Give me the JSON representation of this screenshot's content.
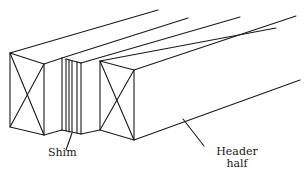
{
  "diagram": {
    "type": "technical-illustration",
    "stroke_color": "#1a1a1a",
    "background_color": "#ffffff",
    "components": [
      {
        "id": "header-half-left",
        "description": "Left header half, end grain shown with X"
      },
      {
        "id": "shim",
        "description": "Thin shim layers between header halves"
      },
      {
        "id": "header-half-right",
        "description": "Right header half, end grain shown with X"
      }
    ]
  },
  "labels": {
    "shim": "Shim",
    "header_half_line1": "Header",
    "header_half_line2": "half"
  }
}
